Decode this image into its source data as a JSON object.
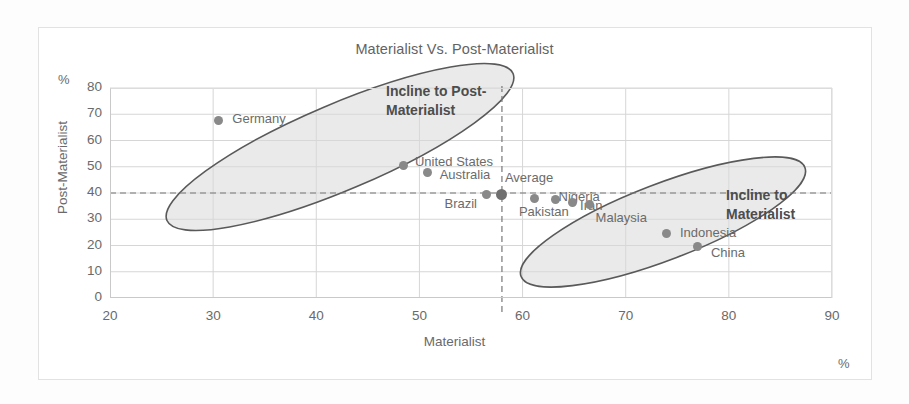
{
  "chart_data": {
    "type": "scatter",
    "title": "Materialist Vs. Post-Materialist",
    "xlabel": "Materialist",
    "ylabel": "Post-Materialist",
    "x_unit": "%",
    "y_unit": "%",
    "xlim": [
      20,
      90
    ],
    "ylim": [
      0,
      80
    ],
    "xticks": [
      20,
      30,
      40,
      50,
      60,
      70,
      80,
      90
    ],
    "yticks": [
      0,
      10,
      20,
      30,
      40,
      50,
      60,
      70,
      80
    ],
    "grid": true,
    "legend": "none",
    "reference_lines": [
      {
        "name": "horizontal-average",
        "axis": "y",
        "value": 40,
        "style": "dashed"
      },
      {
        "name": "vertical-average",
        "axis": "x",
        "value": 58,
        "style": "dashed"
      }
    ],
    "points": [
      {
        "label": "Germany",
        "x": 30.5,
        "y": 67.5,
        "label_dx": 14,
        "label_dy": -8,
        "emphasis": false
      },
      {
        "label": "United States",
        "x": 48.5,
        "y": 50.5,
        "label_dx": 11,
        "label_dy": -9,
        "emphasis": false
      },
      {
        "label": "Australia",
        "x": 50.8,
        "y": 48.0,
        "label_dx": 12,
        "label_dy": -3,
        "emphasis": false
      },
      {
        "label": "Brazil",
        "x": 56.5,
        "y": 39.5,
        "label_dx": -42,
        "label_dy": 4,
        "emphasis": false
      },
      {
        "label": "Average",
        "x": 58.0,
        "y": 39.5,
        "label_dx": 3,
        "label_dy": -22,
        "emphasis": true
      },
      {
        "label": "Pakistan",
        "x": 61.2,
        "y": 38.0,
        "label_dx": -16,
        "label_dy": 8,
        "emphasis": false
      },
      {
        "label": "Nigeria",
        "x": 63.2,
        "y": 37.5,
        "label_dx": 3,
        "label_dy": -9,
        "emphasis": false
      },
      {
        "label": "Iran",
        "x": 64.8,
        "y": 36.5,
        "label_dx": 8,
        "label_dy": -2,
        "emphasis": false
      },
      {
        "label": "Malaysia",
        "x": 66.5,
        "y": 35.5,
        "label_dx": 6,
        "label_dy": 7,
        "emphasis": false
      },
      {
        "label": "Indonesia",
        "x": 74.0,
        "y": 24.5,
        "label_dx": 13,
        "label_dy": -7,
        "emphasis": false
      },
      {
        "label": "China",
        "x": 77.0,
        "y": 19.5,
        "label_dx": 13,
        "label_dy": 0,
        "emphasis": false
      }
    ],
    "clusters": [
      {
        "name": "post-materialist-cluster",
        "cx": 340,
        "cy": 147,
        "rx": 188,
        "ry": 43,
        "rotation": -23
      },
      {
        "name": "materialist-cluster",
        "cx": 663,
        "cy": 222,
        "rx": 152,
        "ry": 38,
        "rotation": -21
      }
    ],
    "annotations": [
      {
        "name": "incline-to-post-materialist",
        "text": "Incline to Post-\nMaterialist",
        "x": 386,
        "y": 82
      },
      {
        "name": "incline-to-materialist",
        "text": "Incline to\nMaterialist",
        "x": 726,
        "y": 186
      }
    ],
    "colors": {
      "marker": "#898989",
      "marker_emphasis": "#6f6f6f",
      "cluster_fill": "#d9d9d9",
      "cluster_stroke": "#595959",
      "grid": "#d6d6d6",
      "text": "#6a6a6a",
      "background": "#ffffff"
    }
  }
}
